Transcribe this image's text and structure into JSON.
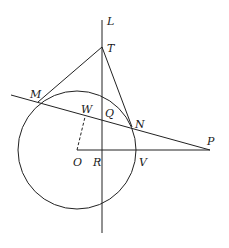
{
  "diagram": {
    "type": "geometry",
    "colors": {
      "background": "#ffffff",
      "ink": "#222222"
    },
    "points": {
      "L": {
        "label": "L",
        "x": 102,
        "y": 20
      },
      "T": {
        "label": "T",
        "x": 102,
        "y": 47
      },
      "M": {
        "label": "M",
        "x": 38,
        "y": 102
      },
      "W": {
        "label": "W",
        "x": 85,
        "y": 116
      },
      "Q": {
        "label": "Q",
        "x": 102,
        "y": 120
      },
      "N": {
        "label": "N",
        "x": 132,
        "y": 127
      },
      "O": {
        "label": "O",
        "x": 77,
        "y": 150
      },
      "R": {
        "label": "R",
        "x": 102,
        "y": 150
      },
      "V": {
        "label": "V",
        "x": 136,
        "y": 150
      },
      "P": {
        "label": "P",
        "x": 210,
        "y": 150
      }
    },
    "circle": {
      "center": "O",
      "radius": 59
    },
    "segments": [
      {
        "from": "T",
        "to": "M",
        "style": "solid"
      },
      {
        "from": "T",
        "to": "N",
        "style": "solid"
      },
      {
        "from": "O",
        "to": "P",
        "style": "solid"
      },
      {
        "from": "O",
        "to": "W",
        "style": "dashed"
      }
    ],
    "lines": [
      {
        "name": "L",
        "description": "vertical line through T, Q, R"
      },
      {
        "name": "secant",
        "description": "line through M, W, Q, N, P"
      }
    ],
    "labels": [
      "L",
      "T",
      "M",
      "W",
      "Q",
      "N",
      "P",
      "O",
      "R",
      "V"
    ]
  }
}
